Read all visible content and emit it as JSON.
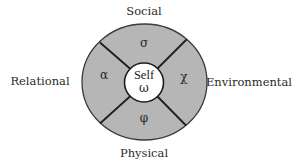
{
  "diagram": {
    "center": {
      "label": "Self",
      "symbol": "ω"
    },
    "quadrants": {
      "top": {
        "symbol": "σ",
        "label": "Social"
      },
      "right": {
        "symbol": "χ",
        "label": "Environmental"
      },
      "bottom": {
        "symbol": "φ",
        "label": "Physical"
      },
      "left": {
        "symbol": "α",
        "label": "Relational"
      }
    },
    "colors": {
      "ring_fill": "#b6b6b6",
      "center_fill": "#ffffff",
      "stroke": "#1e1e1e",
      "background": "#ffffff"
    }
  }
}
